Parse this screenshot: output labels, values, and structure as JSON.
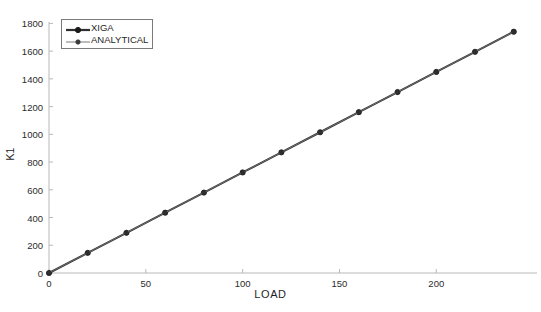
{
  "chart_data": {
    "type": "line",
    "title": "",
    "xlabel": "LOAD",
    "ylabel": "K1",
    "xlim": [
      0,
      252
    ],
    "ylim": [
      0,
      1810
    ],
    "xticks": [
      0,
      50,
      100,
      150,
      200
    ],
    "yticks": [
      0,
      200,
      400,
      600,
      800,
      1000,
      1200,
      1400,
      1600,
      1800
    ],
    "grid": false,
    "legend_position": "upper-left",
    "x": [
      0,
      20,
      40,
      60,
      80,
      100,
      120,
      140,
      160,
      180,
      200,
      220,
      240
    ],
    "series": [
      {
        "name": "XIGA",
        "color": "#2f2f2f",
        "marker": "circle",
        "linewidth": 2,
        "values": [
          0,
          145,
          290,
          435,
          580,
          725,
          870,
          1015,
          1160,
          1305,
          1450,
          1595,
          1740
        ]
      },
      {
        "name": "ANALYTICAL",
        "color": "#6e6e6e",
        "marker": "circle",
        "linewidth": 1,
        "values": [
          0,
          145,
          290,
          435,
          580,
          725,
          870,
          1015,
          1160,
          1305,
          1450,
          1595,
          1740
        ]
      }
    ]
  },
  "axes": {
    "ylabel": "K1",
    "xlabel": "LOAD",
    "ytick_labels": [
      "0",
      "200",
      "400",
      "600",
      "800",
      "1000",
      "1200",
      "1400",
      "1600",
      "1800"
    ],
    "xtick_labels": [
      "0",
      "50",
      "100",
      "150",
      "200"
    ],
    "axis_color": "#b9b9b9"
  },
  "legend": {
    "entries": [
      {
        "label": "XIGA",
        "color": "#2f2f2f",
        "linewidth": 2.2,
        "marker": "circle"
      },
      {
        "label": "ANALYTICAL",
        "color": "#7a7a7a",
        "linewidth": 1,
        "marker": "circle"
      }
    ]
  }
}
